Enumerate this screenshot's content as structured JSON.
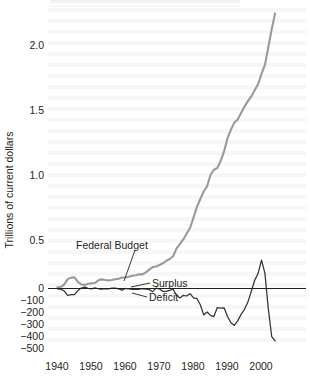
{
  "chart_data": {
    "type": "line",
    "title": "",
    "xlabel": "",
    "ylabel": "Trillions of current dollars",
    "xlim": [
      1940,
      2004
    ],
    "ylim_upper": [
      0,
      2.35
    ],
    "grid": false,
    "legend_position": "inline-annotations",
    "x_ticks": [
      "1940",
      "1950",
      "1960",
      "1970",
      "1980",
      "1990",
      "2000"
    ],
    "y_ticks_upper": [
      "2.0",
      "1.5",
      "1.0",
      "0.5",
      "0"
    ],
    "y_ticks_lower": [
      "-100",
      "-200",
      "-300",
      "-400",
      "-500"
    ],
    "annotations": [
      {
        "text": "Federal Budget",
        "x": 1958,
        "y": 0.62
      },
      {
        "text": "Surplus",
        "x": 1965,
        "y": 0.06
      },
      {
        "text": "Deficit",
        "x": 1964,
        "y": -0.1
      }
    ],
    "series": [
      {
        "name": "Federal Budget",
        "color": "#9a9a9a",
        "units": "trillions of current dollars",
        "x": [
          1940,
          1941,
          1942,
          1943,
          1944,
          1945,
          1946,
          1947,
          1948,
          1949,
          1950,
          1951,
          1952,
          1953,
          1954,
          1955,
          1956,
          1957,
          1958,
          1959,
          1960,
          1961,
          1962,
          1963,
          1964,
          1965,
          1966,
          1967,
          1968,
          1969,
          1970,
          1971,
          1972,
          1973,
          1974,
          1975,
          1976,
          1977,
          1978,
          1979,
          1980,
          1981,
          1982,
          1983,
          1984,
          1985,
          1986,
          1987,
          1988,
          1989,
          1990,
          1991,
          1992,
          1993,
          1994,
          1995,
          1996,
          1997,
          1998,
          1999,
          2000,
          2001,
          2002,
          2003,
          2004
        ],
        "values": [
          0.01,
          0.014,
          0.035,
          0.078,
          0.091,
          0.093,
          0.055,
          0.034,
          0.03,
          0.039,
          0.043,
          0.046,
          0.068,
          0.076,
          0.071,
          0.068,
          0.071,
          0.077,
          0.082,
          0.092,
          0.092,
          0.098,
          0.107,
          0.111,
          0.119,
          0.118,
          0.135,
          0.157,
          0.178,
          0.184,
          0.196,
          0.21,
          0.231,
          0.246,
          0.269,
          0.332,
          0.372,
          0.409,
          0.459,
          0.504,
          0.591,
          0.678,
          0.746,
          0.808,
          0.852,
          0.946,
          0.99,
          1.004,
          1.064,
          1.143,
          1.253,
          1.324,
          1.382,
          1.409,
          1.462,
          1.516,
          1.561,
          1.601,
          1.653,
          1.702,
          1.789,
          1.863,
          2.011,
          2.16,
          2.293
        ]
      },
      {
        "name": "Surplus / Deficit",
        "color": "#333333",
        "units": "billions of current dollars",
        "x": [
          1940,
          1941,
          1942,
          1943,
          1944,
          1945,
          1946,
          1947,
          1948,
          1949,
          1950,
          1951,
          1952,
          1953,
          1954,
          1955,
          1956,
          1957,
          1958,
          1959,
          1960,
          1961,
          1962,
          1963,
          1964,
          1965,
          1966,
          1967,
          1968,
          1969,
          1970,
          1971,
          1972,
          1973,
          1974,
          1975,
          1976,
          1977,
          1978,
          1979,
          1980,
          1981,
          1982,
          1983,
          1984,
          1985,
          1986,
          1987,
          1988,
          1989,
          1990,
          1991,
          1992,
          1993,
          1994,
          1995,
          1996,
          1997,
          1998,
          1999,
          2000,
          2001,
          2002,
          2003,
          2004
        ],
        "values": [
          -3,
          -5,
          -20,
          -55,
          -48,
          -48,
          -16,
          4,
          12,
          1,
          -3,
          6,
          -2,
          -6,
          -1,
          -3,
          4,
          3,
          -3,
          -13,
          0,
          -3,
          -7,
          -5,
          -6,
          -1,
          -4,
          -9,
          -25,
          3,
          -3,
          -23,
          -23,
          -15,
          -6,
          -53,
          -74,
          -54,
          -59,
          -41,
          -74,
          -79,
          -128,
          -208,
          -185,
          -212,
          -221,
          -150,
          -155,
          -152,
          -221,
          -269,
          -290,
          -255,
          -203,
          -164,
          -107,
          -22,
          69,
          126,
          236,
          128,
          -158,
          -378,
          -413
        ]
      }
    ],
    "zero_line": {
      "value": 0,
      "color": "#231f20"
    }
  },
  "axis": {
    "y_title": "Trillions of current dollars"
  },
  "labels": {
    "federal_budget": "Federal Budget",
    "surplus": "Surplus",
    "deficit": "Deficit"
  },
  "yticks_upper": [
    {
      "label": "2.0"
    },
    {
      "label": "1.5"
    },
    {
      "label": "1.0"
    },
    {
      "label": "0.5"
    },
    {
      "label": "0"
    }
  ],
  "yticks_lower": [
    {
      "label": "−100"
    },
    {
      "label": "−200"
    },
    {
      "label": "−300"
    },
    {
      "label": "−400"
    },
    {
      "label": "−500"
    }
  ],
  "xticks": [
    {
      "label": "1940"
    },
    {
      "label": "1950"
    },
    {
      "label": "1960"
    },
    {
      "label": "1970"
    },
    {
      "label": "1980"
    },
    {
      "label": "1990"
    },
    {
      "label": "2000"
    }
  ],
  "colors": {
    "federal_budget_line": "#9a9a9a",
    "deficit_line": "#333333",
    "zero_axis": "#231f20",
    "text": "#231f20"
  }
}
